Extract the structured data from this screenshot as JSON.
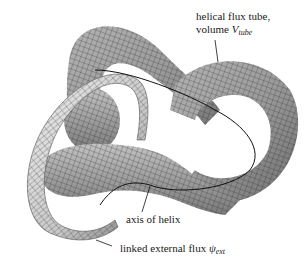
{
  "figure": {
    "labels": {
      "tube": {
        "line1": "helical flux tube,",
        "line2_prefix": "volume ",
        "symbol": "V",
        "subscript": "tube"
      },
      "axis": "axis of helix",
      "external": {
        "prefix": "linked external flux ",
        "symbol": "ψ",
        "subscript": "ext"
      }
    },
    "colors": {
      "tube_fill": "#9a9a9a",
      "tube_dark": "#6e6e6e",
      "ring_fill": "#d8d8d8",
      "ring_dark": "#8a8a8a",
      "mesh_line": "#2a2a2a",
      "axis_line": "#111111",
      "text": "#1a1a1a"
    }
  }
}
